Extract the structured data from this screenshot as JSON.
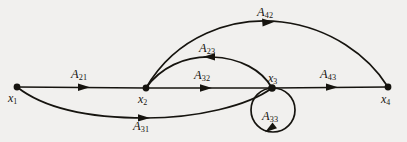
{
  "figure": {
    "type": "signal-flow-graph",
    "background_color": "#f1f0ee",
    "ink_color": "#16140f",
    "nodes": [
      {
        "id": "x1",
        "base": "x",
        "sub": "1",
        "x": 17,
        "y": 87
      },
      {
        "id": "x2",
        "base": "x",
        "sub": "2",
        "x": 146,
        "y": 88
      },
      {
        "id": "x3",
        "base": "x",
        "sub": "3",
        "x": 272,
        "y": 88
      },
      {
        "id": "x4",
        "base": "x",
        "sub": "4",
        "x": 388,
        "y": 87
      }
    ],
    "edges": [
      {
        "id": "A21",
        "base": "A",
        "sub": "21",
        "from": "x1",
        "to": "x2",
        "shape": "straight",
        "direction": "right"
      },
      {
        "id": "A32",
        "base": "A",
        "sub": "32",
        "from": "x2",
        "to": "x3",
        "shape": "straight",
        "direction": "right"
      },
      {
        "id": "A43",
        "base": "A",
        "sub": "43",
        "from": "x3",
        "to": "x4",
        "shape": "straight",
        "direction": "right"
      },
      {
        "id": "A42",
        "base": "A",
        "sub": "42",
        "from": "x2",
        "to": "x4",
        "shape": "arc-above-outer",
        "direction": "right"
      },
      {
        "id": "A23",
        "base": "A",
        "sub": "23",
        "from": "x3",
        "to": "x2",
        "shape": "arc-above-inner",
        "direction": "left"
      },
      {
        "id": "A31",
        "base": "A",
        "sub": "31",
        "from": "x1",
        "to": "x3",
        "shape": "arc-below",
        "direction": "right"
      },
      {
        "id": "A33",
        "base": "A",
        "sub": "33",
        "from": "x3",
        "to": "x3",
        "shape": "self-loop",
        "direction": "counterclockwise"
      }
    ]
  }
}
